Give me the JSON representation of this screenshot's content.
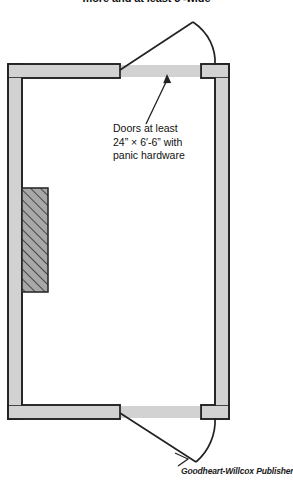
{
  "figure": {
    "type": "architectural-floor-plan",
    "title_caption": "more and at least 3'-wide",
    "credit": "Goodheart-Willcox Publisher",
    "annotation": {
      "line1": "Doors at least",
      "line2": "24” × 6′-6” with",
      "line3": "panic hardware"
    }
  },
  "colors": {
    "wall_fill": "#d2d2d2",
    "wall_stroke": "#222222",
    "hatch_fill": "#9d9d9d",
    "hatch_stroke": "#2b2b2b",
    "door_stroke": "#222222",
    "background": "#ffffff",
    "text": "#111111"
  },
  "geometry": {
    "room": {
      "outer_left": 8,
      "outer_top": 64,
      "outer_right": 229,
      "outer_bottom": 419,
      "wall_thickness": 14
    },
    "top_door": {
      "hinge_x": 120,
      "hinge_y": 71,
      "leaf_end_x": 193,
      "leaf_end_y": 22,
      "arc_end_x": 215,
      "arc_end_y": 64
    },
    "bottom_door": {
      "hinge_x": 120,
      "hinge_y": 412,
      "leaf_end_x": 196,
      "leaf_end_y": 462,
      "arc_end_x": 215,
      "arc_end_y": 419
    },
    "hatched_block": {
      "x": 22,
      "y": 188,
      "width": 26,
      "height": 104
    }
  }
}
